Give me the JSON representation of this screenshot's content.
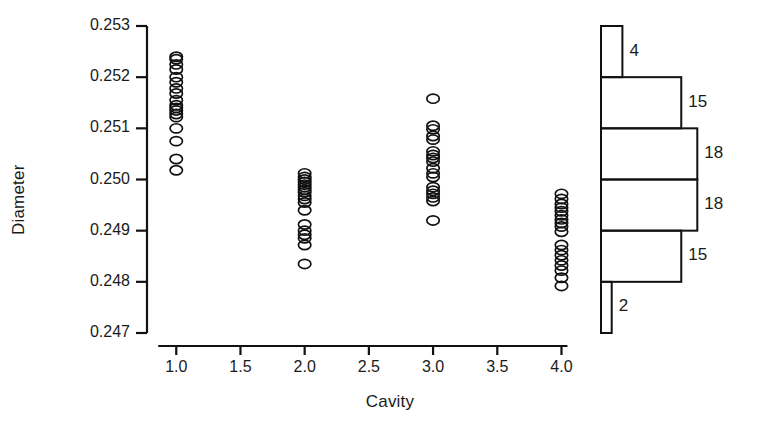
{
  "chart_data": {
    "type": "scatter",
    "title": "",
    "xlabel": "Cavity",
    "ylabel": "Diameter",
    "xlim": [
      0.78,
      4.3
    ],
    "ylim": [
      0.247,
      0.253
    ],
    "grid": false,
    "legend": "none",
    "marker": "open-circle",
    "xticks": [
      "1.0",
      "1.5",
      "2.0",
      "2.5",
      "3.0",
      "3.5",
      "4.0"
    ],
    "xtick_values": [
      1.0,
      1.5,
      2.0,
      2.5,
      3.0,
      3.5,
      4.0
    ],
    "yticks": [
      "0.247",
      "0.248",
      "0.249",
      "0.250",
      "0.251",
      "0.252",
      "0.253"
    ],
    "ytick_values": [
      0.247,
      0.248,
      0.249,
      0.25,
      0.251,
      0.252,
      0.253
    ],
    "series": [
      {
        "name": "Cavity 1",
        "x": 1.0,
        "values": [
          0.2524,
          0.25235,
          0.25225,
          0.25215,
          0.252,
          0.2519,
          0.25178,
          0.25168,
          0.25155,
          0.25145,
          0.2514,
          0.25135,
          0.25128,
          0.25122,
          0.251,
          0.25075,
          0.2504,
          0.25018
        ]
      },
      {
        "name": "Cavity 2",
        "x": 2.0,
        "values": [
          0.25012,
          0.25005,
          0.25,
          0.24995,
          0.2499,
          0.24985,
          0.2498,
          0.24975,
          0.24968,
          0.24962,
          0.24955,
          0.2494,
          0.24912,
          0.249,
          0.24892,
          0.24885,
          0.24872,
          0.24835
        ]
      },
      {
        "name": "Cavity 3",
        "x": 3.0,
        "values": [
          0.25158,
          0.25105,
          0.25098,
          0.25085,
          0.25078,
          0.25055,
          0.25048,
          0.25042,
          0.25035,
          0.25022,
          0.25012,
          0.25005,
          0.24985,
          0.24978,
          0.24972,
          0.24965,
          0.24958,
          0.2492
        ]
      },
      {
        "name": "Cavity 4",
        "x": 4.0,
        "values": [
          0.24972,
          0.24962,
          0.24952,
          0.24945,
          0.24938,
          0.2493,
          0.24922,
          0.24915,
          0.24908,
          0.24898,
          0.24872,
          0.24862,
          0.24852,
          0.24842,
          0.24832,
          0.24822,
          0.24808,
          0.24792
        ]
      }
    ],
    "histogram": {
      "orientation": "horizontal",
      "position": "right",
      "bin_edges": [
        0.247,
        0.248,
        0.249,
        0.25,
        0.251,
        0.252,
        0.253
      ],
      "counts_top_to_bottom": [
        4,
        15,
        18,
        18,
        15,
        2
      ],
      "labels_top_to_bottom": [
        "4",
        "15",
        "18",
        "18",
        "15",
        "2"
      ],
      "total": 72
    }
  },
  "style": {
    "ink": "#111111",
    "background": "#ffffff"
  }
}
